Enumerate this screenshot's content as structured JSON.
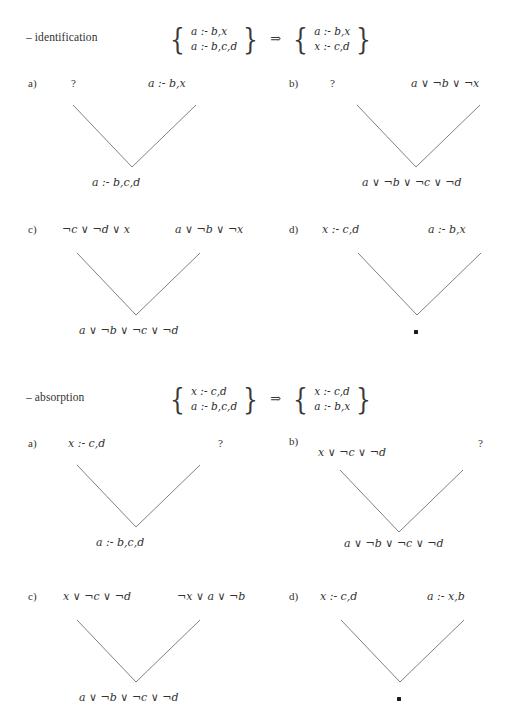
{
  "page": {
    "width": 522,
    "height": 726,
    "background": "#ffffff",
    "ink": "#33322f",
    "line_color": "#6a6a6a"
  },
  "sections": [
    {
      "id": "identification",
      "name": "– identification",
      "transform": {
        "left_set": [
          "a :- b,x",
          "a :- b,c,d"
        ],
        "arrow": "⇒",
        "right_set": [
          "a :- b,x",
          "x :- c,d"
        ]
      },
      "cases": [
        {
          "marker": "a)",
          "left_premise": "?",
          "right_premise": "a :- b,x",
          "conclusion": "a :- b,c,d"
        },
        {
          "marker": "b)",
          "left_premise": "?",
          "right_premise": "a ∨ ¬b ∨ ¬x",
          "conclusion": "a ∨ ¬b ∨ ¬c ∨ ¬d"
        },
        {
          "marker": "c)",
          "left_premise": "¬c ∨ ¬d ∨ x",
          "right_premise": "a ∨ ¬b ∨ ¬x",
          "conclusion": "a ∨ ¬b ∨ ¬c ∨ ¬d"
        },
        {
          "marker": "d)",
          "left_premise": "x :- c,d",
          "right_premise": "a :- b,x",
          "conclusion": "□"
        }
      ]
    },
    {
      "id": "absorption",
      "name": "– absorption",
      "transform": {
        "left_set": [
          "x :- c,d",
          "a :- b,c,d"
        ],
        "arrow": "⇒",
        "right_set": [
          "x :- c,d",
          "a :- b,x"
        ]
      },
      "cases": [
        {
          "marker": "a)",
          "left_premise": "x :- c,d",
          "right_premise": "?",
          "conclusion": "a :- b,c,d"
        },
        {
          "marker": "b)",
          "left_premise": "x ∨ ¬c ∨ ¬d",
          "right_premise": "?",
          "conclusion": "a ∨ ¬b ∨ ¬c ∨ ¬d"
        },
        {
          "marker": "c)",
          "left_premise": "x ∨ ¬c ∨ ¬d",
          "right_premise": "¬x ∨ a ∨ ¬b",
          "conclusion": "a ∨ ¬b ∨ ¬c ∨ ¬d"
        },
        {
          "marker": "d)",
          "left_premise": "x :- c,d",
          "right_premise": "a :- x,b",
          "conclusion": "□"
        }
      ]
    }
  ]
}
